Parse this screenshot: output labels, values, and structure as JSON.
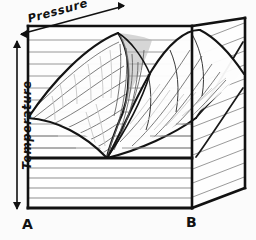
{
  "figure": {
    "kind": "hand-drawn-3d-block-diagram",
    "background_color": "#fbfbfb",
    "ink_color": "#111111",
    "hatch_color": "#8a8a8a",
    "shade_color": "#b9b9b9"
  },
  "axes": {
    "pressure": {
      "label": "Pressure",
      "direction": "diagonal-up-right",
      "arrow": "double-headed",
      "arrow_start_x": 20,
      "arrow_start_y": 34,
      "arrow_end_x": 124,
      "arrow_end_y": 6
    },
    "temperature": {
      "label": "Temperature",
      "direction": "vertical",
      "arrow": "double-headed",
      "arrow_start_x": 17,
      "arrow_start_y": 40,
      "arrow_end_x": 17,
      "arrow_end_y": 210
    }
  },
  "corners": {
    "front_left": {
      "label": "A",
      "x": 25,
      "y": 224
    },
    "front_right": {
      "label": "B",
      "x": 190,
      "y": 222
    }
  },
  "geometry": {
    "front_face": {
      "left_x": 28,
      "right_x": 192,
      "top_y": 26,
      "bottom_y": 208,
      "divider_y": 158,
      "lower_hatch_ys": [
        168,
        178,
        188,
        198
      ],
      "upper_hatch_ys": [
        40,
        52,
        64,
        76,
        88,
        100,
        112,
        124,
        136,
        148
      ]
    },
    "side_face": {
      "near_top_x": 192,
      "near_top_y": 26,
      "far_top_x": 245,
      "far_top_y": 18,
      "far_bottom_y": 188,
      "near_bottom_y": 208,
      "hatch_count": 14
    },
    "top_edge": {
      "left_x": 28,
      "left_y": 26,
      "right_x": 192,
      "right_y": 26
    },
    "cusp": {
      "apex_x": 107,
      "apex_y": 158,
      "description": "sharp valley point where the two curved surfaces meet the base"
    },
    "left_dome": {
      "crest_top_x": 118,
      "crest_top_y": 34,
      "contour_count": 9
    },
    "right_dome": {
      "crest_top_x": 196,
      "crest_top_y": 30,
      "contour_count": 6
    }
  }
}
